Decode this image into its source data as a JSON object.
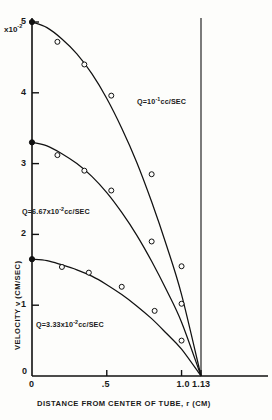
{
  "figure": {
    "scale_factor_prefix": "x10",
    "scale_factor_exponent": "-2"
  },
  "axes": {
    "x_title": "DISTANCE  FROM CENTER OF TUBE, r (CM)",
    "y_title": "VELOCITY v (CM/SEC)",
    "x_ticks": [
      "0",
      ".5",
      "1.0",
      "1.13"
    ],
    "y_ticks": [
      "0",
      "1",
      "2",
      "3",
      "4",
      "5"
    ],
    "origin_label": "0"
  },
  "curves": [
    {
      "label_prefix": "Q=10",
      "label_exponent": "-1",
      "label_suffix": "cc/SEC"
    },
    {
      "label_prefix": "Q=6.67x10",
      "label_exponent": "-2",
      "label_suffix": "cc/SEC"
    },
    {
      "label_prefix": "Q=3.33x10",
      "label_exponent": "-2",
      "label_suffix": "cc/SEC"
    }
  ],
  "chart_data": {
    "type": "scatter",
    "title": "",
    "xlabel": "DISTANCE FROM CENTER OF TUBE, r (CM)",
    "ylabel": "VELOCITY v (CM/SEC)",
    "y_scale": "x10^-2",
    "xlim": [
      0,
      1.28
    ],
    "ylim": [
      0,
      5
    ],
    "xticks": [
      0,
      0.5,
      1.0,
      1.13
    ],
    "xticklabels": [
      "0",
      ".5",
      "1.0",
      "1.13"
    ],
    "yticks": [
      0,
      1,
      2,
      3,
      4,
      5
    ],
    "yticklabels": [
      "0",
      "1",
      "2",
      "3",
      "4",
      "5"
    ],
    "grid": false,
    "legend": "inline-annotations",
    "wall_radius": 1.13,
    "annotations": [
      {
        "text": "Q=10^-1 cc/SEC",
        "x": 0.62,
        "y": 4.1
      },
      {
        "text": "Q=6.67x10^-2 cc/SEC",
        "x": 0.06,
        "y": 2.46
      },
      {
        "text": "Q=3.33x10^-2 cc/SEC",
        "x": 0.13,
        "y": 0.85
      },
      {
        "text": "x10^-2 (y-axis scale factor)",
        "x": 0.0,
        "y": 5.0
      }
    ],
    "series": [
      {
        "name": "Q=10^-1 cc/SEC",
        "curve_peak": 5.0,
        "points": [
          {
            "x": 0.0,
            "y": 5.0
          },
          {
            "x": 0.17,
            "y": 4.72
          },
          {
            "x": 0.35,
            "y": 4.4
          },
          {
            "x": 0.53,
            "y": 3.96
          },
          {
            "x": 0.8,
            "y": 2.85
          },
          {
            "x": 1.0,
            "y": 1.55
          }
        ],
        "fit_curve": [
          {
            "x": 0.0,
            "y": 5.0
          },
          {
            "x": 0.1,
            "y": 4.92
          },
          {
            "x": 0.2,
            "y": 4.76
          },
          {
            "x": 0.3,
            "y": 4.55
          },
          {
            "x": 0.4,
            "y": 4.27
          },
          {
            "x": 0.5,
            "y": 3.92
          },
          {
            "x": 0.6,
            "y": 3.5
          },
          {
            "x": 0.7,
            "y": 3.02
          },
          {
            "x": 0.8,
            "y": 2.46
          },
          {
            "x": 0.9,
            "y": 1.84
          },
          {
            "x": 1.0,
            "y": 1.15
          },
          {
            "x": 1.13,
            "y": 0.0
          }
        ]
      },
      {
        "name": "Q=6.67x10^-2 cc/SEC",
        "curve_peak": 3.3,
        "points": [
          {
            "x": 0.0,
            "y": 3.3
          },
          {
            "x": 0.17,
            "y": 3.12
          },
          {
            "x": 0.35,
            "y": 2.9
          },
          {
            "x": 0.53,
            "y": 2.62
          },
          {
            "x": 0.8,
            "y": 1.9
          },
          {
            "x": 1.0,
            "y": 1.02
          }
        ],
        "fit_curve": [
          {
            "x": 0.0,
            "y": 3.3
          },
          {
            "x": 0.1,
            "y": 3.25
          },
          {
            "x": 0.2,
            "y": 3.14
          },
          {
            "x": 0.3,
            "y": 3.0
          },
          {
            "x": 0.4,
            "y": 2.82
          },
          {
            "x": 0.5,
            "y": 2.59
          },
          {
            "x": 0.6,
            "y": 2.31
          },
          {
            "x": 0.7,
            "y": 1.99
          },
          {
            "x": 0.8,
            "y": 1.62
          },
          {
            "x": 0.9,
            "y": 1.21
          },
          {
            "x": 1.0,
            "y": 0.76
          },
          {
            "x": 1.13,
            "y": 0.0
          }
        ]
      },
      {
        "name": "Q=3.33x10^-2 cc/SEC",
        "curve_peak": 1.65,
        "points": [
          {
            "x": 0.0,
            "y": 1.65
          },
          {
            "x": 0.2,
            "y": 1.54
          },
          {
            "x": 0.38,
            "y": 1.46
          },
          {
            "x": 0.6,
            "y": 1.26
          },
          {
            "x": 0.82,
            "y": 0.92
          },
          {
            "x": 1.0,
            "y": 0.5
          }
        ],
        "fit_curve": [
          {
            "x": 0.0,
            "y": 1.65
          },
          {
            "x": 0.1,
            "y": 1.63
          },
          {
            "x": 0.2,
            "y": 1.57
          },
          {
            "x": 0.3,
            "y": 1.5
          },
          {
            "x": 0.4,
            "y": 1.41
          },
          {
            "x": 0.5,
            "y": 1.29
          },
          {
            "x": 0.6,
            "y": 1.15
          },
          {
            "x": 0.7,
            "y": 0.99
          },
          {
            "x": 0.8,
            "y": 0.81
          },
          {
            "x": 0.9,
            "y": 0.6
          },
          {
            "x": 1.0,
            "y": 0.38
          },
          {
            "x": 1.13,
            "y": 0.0
          }
        ]
      }
    ]
  }
}
